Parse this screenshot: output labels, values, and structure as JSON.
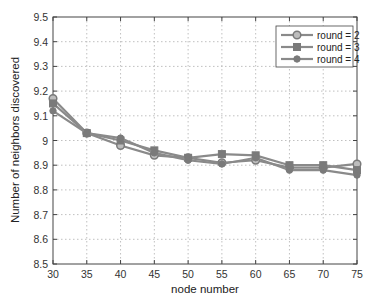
{
  "chart_data": {
    "type": "line",
    "title": "",
    "xlabel": "node number",
    "ylabel": "Number of neighbors discovered",
    "x": [
      30,
      35,
      40,
      45,
      50,
      55,
      60,
      65,
      70,
      75
    ],
    "xlim": [
      30,
      75
    ],
    "ylim": [
      8.5,
      9.5
    ],
    "xticks": [
      30,
      35,
      40,
      45,
      50,
      55,
      60,
      65,
      70,
      75
    ],
    "yticks": [
      8.5,
      8.6,
      8.7,
      8.8,
      8.9,
      9,
      9.1,
      9.2,
      9.3,
      9.4,
      9.5
    ],
    "ytick_labels": [
      "8.5",
      "8.6",
      "8.7",
      "8.8",
      "8.9",
      "9",
      "9.1",
      "9.2",
      "9.3",
      "9.4",
      "9.5"
    ],
    "grid": true,
    "legend_position": "upper right",
    "series": [
      {
        "name": "round = 2",
        "marker": "circle-open",
        "values": [
          9.17,
          9.03,
          8.98,
          8.94,
          8.93,
          8.91,
          8.92,
          8.89,
          8.89,
          8.905
        ]
      },
      {
        "name": "round = 3",
        "marker": "square",
        "values": [
          9.15,
          9.03,
          9.0,
          8.96,
          8.93,
          8.945,
          8.94,
          8.9,
          8.9,
          8.88
        ]
      },
      {
        "name": "round = 4",
        "marker": "circle-filled",
        "values": [
          9.12,
          9.03,
          9.01,
          8.95,
          8.92,
          8.905,
          8.93,
          8.88,
          8.88,
          8.86
        ]
      }
    ]
  },
  "colors": {
    "line": "#8a8a8a",
    "marker": "#7a7a7a",
    "grid": "#b0b0b0",
    "axis": "#444444"
  }
}
